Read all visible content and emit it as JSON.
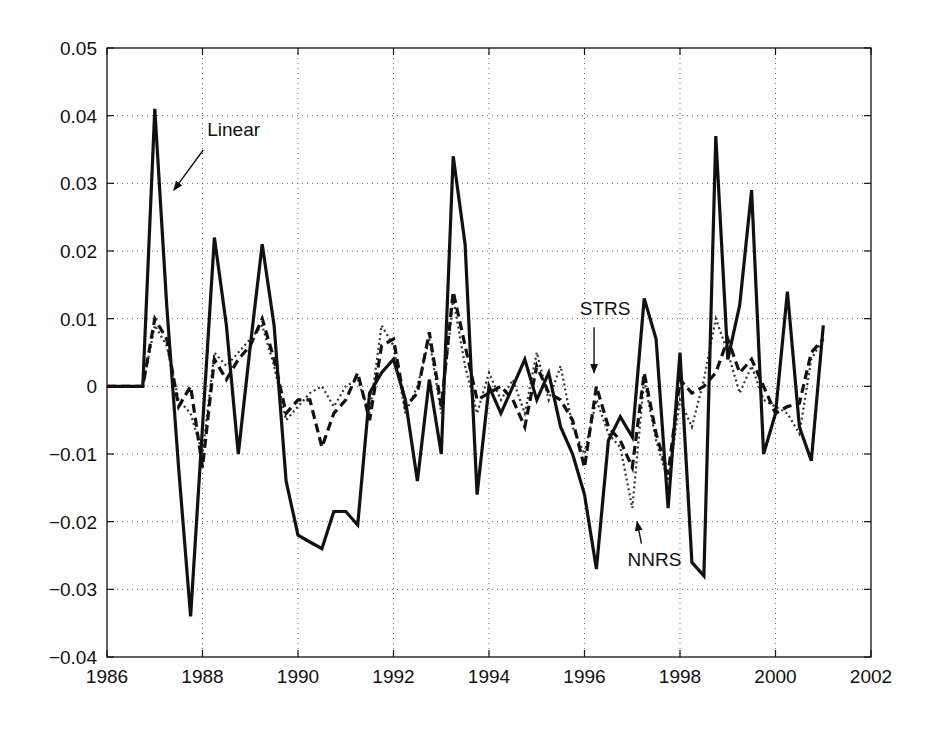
{
  "chart_data": {
    "type": "line",
    "title": "",
    "xlabel": "",
    "ylabel": "",
    "xlim": [
      1986,
      2002
    ],
    "ylim": [
      -0.04,
      0.05
    ],
    "grid": true,
    "legend": "none (inline annotations with arrows)",
    "x_ticks": [
      1986,
      1988,
      1990,
      1992,
      1994,
      1996,
      1998,
      2000,
      2002
    ],
    "x_tick_labels": [
      "1986",
      "1988",
      "1990",
      "1992",
      "1994",
      "1996",
      "1998",
      "2000",
      "2002"
    ],
    "y_ticks": [
      -0.04,
      -0.03,
      -0.02,
      -0.01,
      0,
      0.01,
      0.02,
      0.03,
      0.04,
      0.05
    ],
    "y_tick_labels": [
      "−0.04",
      "−0.03",
      "−0.02",
      "−0.01",
      "0",
      "0.01",
      "0.02",
      "0.03",
      "0.04",
      "0.05"
    ],
    "x": [
      1986.0,
      1986.25,
      1986.5,
      1986.75,
      1987.0,
      1987.25,
      1987.5,
      1987.75,
      1988.0,
      1988.25,
      1988.5,
      1988.75,
      1989.0,
      1989.25,
      1989.5,
      1989.75,
      1990.0,
      1990.25,
      1990.5,
      1990.75,
      1991.0,
      1991.25,
      1991.5,
      1991.75,
      1992.0,
      1992.25,
      1992.5,
      1992.75,
      1993.0,
      1993.25,
      1993.5,
      1993.75,
      1994.0,
      1994.25,
      1994.5,
      1994.75,
      1995.0,
      1995.25,
      1995.5,
      1995.75,
      1996.0,
      1996.25,
      1996.5,
      1996.75,
      1997.0,
      1997.25,
      1997.5,
      1997.75,
      1998.0,
      1998.25,
      1998.5,
      1998.75,
      1999.0,
      1999.25,
      1999.5,
      1999.75,
      2000.0,
      2000.25,
      2000.5,
      2000.75,
      2001.0
    ],
    "series": [
      {
        "name": "Linear",
        "style": "solid",
        "values": [
          0,
          0,
          0,
          0,
          0.041,
          0.012,
          -0.012,
          -0.034,
          -0.006,
          0.022,
          0.009,
          -0.01,
          0.006,
          0.021,
          0.009,
          -0.014,
          -0.022,
          -0.023,
          -0.024,
          -0.0185,
          -0.0185,
          -0.0205,
          -0.001,
          0.002,
          0.004,
          -0.002,
          -0.014,
          0.001,
          -0.01,
          0.034,
          0.021,
          -0.016,
          0.0,
          -0.004,
          0.0,
          0.004,
          -0.002,
          0.002,
          -0.006,
          -0.01,
          -0.016,
          -0.027,
          -0.008,
          -0.0045,
          -0.0075,
          0.013,
          0.007,
          -0.018,
          0.005,
          -0.026,
          -0.028,
          0.037,
          0.004,
          0.012,
          0.029,
          -0.01,
          -0.004,
          0.014,
          -0.006,
          -0.011,
          0.009
        ]
      },
      {
        "name": "STRS",
        "style": "dashed",
        "values": [
          0,
          0,
          0,
          0,
          0.01,
          0.007,
          -0.003,
          0.0,
          -0.012,
          0.004,
          0.001,
          0.004,
          0.006,
          0.01,
          0.004,
          -0.004,
          -0.002,
          -0.002,
          -0.009,
          -0.004,
          -0.002,
          0.002,
          -0.005,
          0.006,
          0.007,
          -0.003,
          -0.001,
          0.008,
          -0.003,
          0.014,
          0.006,
          -0.002,
          -0.001,
          0.0,
          -0.002,
          -0.006,
          0.003,
          -0.001,
          -0.002,
          -0.005,
          -0.012,
          0.0,
          -0.006,
          -0.008,
          -0.012,
          0.002,
          -0.007,
          -0.013,
          0.001,
          -0.001,
          0.0,
          0.002,
          0.007,
          0.002,
          0.004,
          0.0,
          -0.004,
          -0.003,
          -0.0025,
          0.005,
          0.007
        ]
      },
      {
        "name": "NNRS",
        "style": "dotted",
        "values": [
          0,
          0,
          0,
          0,
          0.009,
          0.006,
          -0.002,
          -0.004,
          -0.01,
          0.005,
          0.003,
          0.005,
          0.007,
          0.009,
          0.003,
          -0.005,
          -0.003,
          -0.001,
          0.0,
          -0.003,
          0.0,
          0.001,
          -0.004,
          0.009,
          0.006,
          -0.004,
          0.0,
          0.007,
          -0.004,
          0.013,
          0.003,
          -0.004,
          0.002,
          -0.002,
          0.001,
          -0.004,
          0.005,
          -0.002,
          0.003,
          -0.006,
          -0.01,
          -0.002,
          -0.007,
          -0.009,
          -0.018,
          0.001,
          -0.008,
          -0.014,
          -0.002,
          -0.006,
          0.001,
          0.01,
          0.005,
          -0.001,
          0.003,
          -0.002,
          -0.003,
          -0.004,
          -0.007,
          0.004,
          0.007
        ]
      }
    ],
    "annotations": [
      {
        "text": "Linear",
        "x": 1988.1,
        "y": 0.037,
        "arrow_to": [
          1987.4,
          0.029
        ]
      },
      {
        "text": "STRS",
        "x": 1995.9,
        "y": 0.0105,
        "arrow_to": [
          1996.2,
          0.002
        ]
      },
      {
        "text": "NNRS",
        "x": 1996.9,
        "y": -0.0265,
        "arrow_to": [
          1997.1,
          -0.02
        ]
      }
    ]
  }
}
